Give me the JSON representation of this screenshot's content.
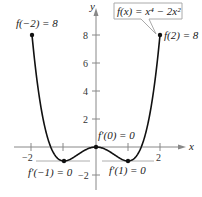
{
  "chart_data": {
    "type": "line",
    "title": "",
    "function": "f(x) = x^4 - 2x^2",
    "xlabel": "x",
    "ylabel": "y",
    "xlim": [
      -2.1,
      2.3
    ],
    "ylim": [
      -2.5,
      9
    ],
    "x_ticks": [
      -2,
      -1,
      1,
      2
    ],
    "x_tick_labels": [
      "-2",
      "2"
    ],
    "y_ticks": [
      -2,
      2,
      4,
      6,
      8
    ],
    "y_tick_labels": [
      "-2",
      "2",
      "4",
      "6",
      "8"
    ],
    "x": [
      -2,
      -1.5,
      -1,
      -0.5,
      0,
      0.5,
      1,
      1.5,
      2
    ],
    "y": [
      8,
      0.5625,
      -1,
      -0.4375,
      0,
      -0.4375,
      -1,
      0.5625,
      8
    ],
    "points": [
      {
        "x": -2,
        "y": 8,
        "label": "f(−2) = 8"
      },
      {
        "x": 2,
        "y": 8,
        "label": "f(2) = 8"
      },
      {
        "x": -1,
        "y": -1,
        "label": "f′(−1) = 0"
      },
      {
        "x": 0,
        "y": 0,
        "label": "f′(0) = 0"
      },
      {
        "x": 1,
        "y": -1,
        "label": "f′(1) = 0"
      }
    ],
    "annotation": "f(x) = x⁴ − 2x²"
  },
  "labels": {
    "f_neg2": "f(−2) = 8",
    "f_pos2": "f(2) = 8",
    "fp_neg1": "f′(−1) = 0",
    "fp_0": "f′(0) = 0",
    "fp_1": "f′(1) = 0",
    "func_box": "f(x) = x⁴ − 2x²",
    "axis_x": "x",
    "axis_y": "y",
    "tick_x_neg2": "−2",
    "tick_x_2": "2",
    "tick_y_8": "8",
    "tick_y_6": "6",
    "tick_y_4": "4",
    "tick_y_2": "2",
    "tick_y_neg2": "−2"
  }
}
